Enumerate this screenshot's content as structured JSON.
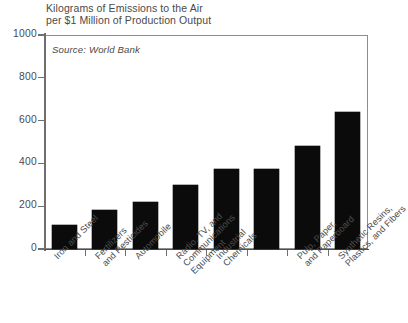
{
  "figure": {
    "title_lines": [
      "Kilograms of Emissions to the Air",
      "per $1 Million of Production Output"
    ],
    "source_note": "Source: World Bank",
    "frame_color": "#8d8d8d",
    "bar_color": "#0b0b0b",
    "text_color": "#4a4a4a"
  },
  "chart_data": {
    "type": "bar",
    "title": "Kilograms of Emissions to the Air per $1 Million of Production Output",
    "subtitle": "Source: World Bank",
    "xlabel": "",
    "ylabel": "",
    "ylim": [
      0,
      1000
    ],
    "yticks": [
      0,
      200,
      400,
      600,
      800,
      1000
    ],
    "ytick_labels": [
      "0",
      "200",
      "400",
      "600",
      "800",
      "1000"
    ],
    "grid": false,
    "legend": false,
    "categories": [
      "Iron and Steel",
      "Fertilizers and Pesticides",
      "Automobile",
      "Radio, TV, and Communications Equipment",
      "Industrial Chemicals",
      "Pulp, Paper, and Paperboard",
      "Synthetic Resins, Plastics, and Fibers"
    ],
    "category_lines": [
      [
        "Iron and Steel"
      ],
      [
        "Fertilizers",
        "and Pesticides"
      ],
      [
        "Automobile"
      ],
      [
        "Radio, TV, and",
        "Communications",
        "Equipment"
      ],
      [
        "Industrial",
        "Chemicals"
      ],
      [
        "Pulp, Paper,",
        "and Paperboard"
      ],
      [
        "Synthetic Resins,",
        "Plastics, and Fibers"
      ]
    ],
    "values": [
      110,
      180,
      220,
      300,
      375,
      480,
      640
    ],
    "bar_count_rendered": 8,
    "bars": [
      {
        "label": "Iron and Steel",
        "value": 110
      },
      {
        "label": "Fertilizers and Pesticides",
        "value": 180
      },
      {
        "label": "Automobile",
        "value": 220
      },
      {
        "label": "Radio, TV, and Communications Equipment",
        "value": 300
      },
      {
        "label": "Industrial Chemicals",
        "value": 375
      },
      {
        "label": "unlabeled",
        "value": 375
      },
      {
        "label": "Pulp, Paper, and Paperboard",
        "value": 480
      },
      {
        "label": "Synthetic Resins, Plastics, and Fibers",
        "value": 640
      }
    ]
  }
}
